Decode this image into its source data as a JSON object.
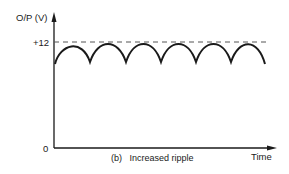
{
  "figure": {
    "y_axis_label": "O/P (V)",
    "x_axis_label": "Time",
    "origin_label": "0",
    "level_label": "+12",
    "caption": "(b)   Increased ripple"
  },
  "colors": {
    "line": "#1a1a1a",
    "dashed": "#555555",
    "background": "#ffffff"
  },
  "waveform": {
    "type": "full-wave rectified ripple",
    "peak_level": "+12",
    "cycles": 6
  }
}
